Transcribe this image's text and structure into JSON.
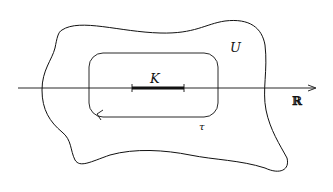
{
  "diagram": {
    "labels": {
      "compact_set": "K",
      "open_set": "U",
      "real_line": "ℝ",
      "contour": "τ"
    },
    "colors": {
      "stroke": "#111111",
      "background": "#ffffff"
    }
  }
}
